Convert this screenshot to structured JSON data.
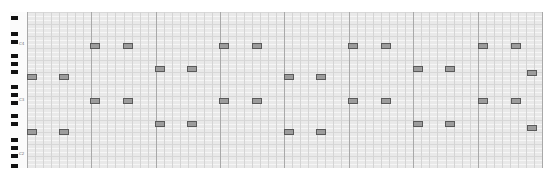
{
  "editor": {
    "name": "piano-roll",
    "colors": {
      "grid_bg": "#e9e9e9",
      "bar_line": "#a9a9a9",
      "beat_line": "#d4d4d4",
      "note_fill": "#9c9c9c",
      "note_border": "#5a5a5a",
      "black_key": "#111111"
    },
    "keyboard": {
      "black_key_y": [
        4,
        20,
        28,
        42,
        50,
        58,
        73,
        81,
        89,
        102,
        110,
        126,
        134,
        142,
        152
      ],
      "labels": [
        {
          "text": "C4",
          "y": 30
        },
        {
          "text": "C3",
          "y": 86
        },
        {
          "text": "C2",
          "y": 140
        }
      ]
    },
    "grid": {
      "bar_x": [
        0,
        64,
        129,
        193,
        257,
        322,
        386,
        451,
        515
      ],
      "beats_per_bar": 4
    },
    "notes": [
      {
        "x": 63,
        "y": 31
      },
      {
        "x": 96,
        "y": 31
      },
      {
        "x": 192,
        "y": 31
      },
      {
        "x": 225,
        "y": 31
      },
      {
        "x": 321,
        "y": 31
      },
      {
        "x": 354,
        "y": 31
      },
      {
        "x": 451,
        "y": 31
      },
      {
        "x": 484,
        "y": 31
      },
      {
        "x": 128,
        "y": 54
      },
      {
        "x": 160,
        "y": 54
      },
      {
        "x": 386,
        "y": 54
      },
      {
        "x": 418,
        "y": 54
      },
      {
        "x": 0,
        "y": 62
      },
      {
        "x": 32,
        "y": 62
      },
      {
        "x": 257,
        "y": 62
      },
      {
        "x": 289,
        "y": 62
      },
      {
        "x": 500,
        "y": 58
      },
      {
        "x": 63,
        "y": 86
      },
      {
        "x": 96,
        "y": 86
      },
      {
        "x": 192,
        "y": 86
      },
      {
        "x": 225,
        "y": 86
      },
      {
        "x": 321,
        "y": 86
      },
      {
        "x": 354,
        "y": 86
      },
      {
        "x": 451,
        "y": 86
      },
      {
        "x": 484,
        "y": 86
      },
      {
        "x": 128,
        "y": 109
      },
      {
        "x": 160,
        "y": 109
      },
      {
        "x": 386,
        "y": 109
      },
      {
        "x": 418,
        "y": 109
      },
      {
        "x": 0,
        "y": 117
      },
      {
        "x": 32,
        "y": 117
      },
      {
        "x": 257,
        "y": 117
      },
      {
        "x": 289,
        "y": 117
      },
      {
        "x": 500,
        "y": 113
      }
    ]
  }
}
